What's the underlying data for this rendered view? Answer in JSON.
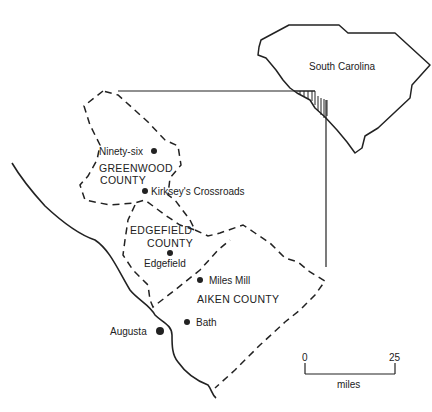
{
  "inset": {
    "state_label": "South Carolina"
  },
  "counties": [
    {
      "line1": "GREENWOOD",
      "line2": "COUNTY"
    },
    {
      "line1": "EDGEFIELD",
      "line2": "COUNTY"
    },
    {
      "line1": "AIKEN COUNTY"
    }
  ],
  "places": [
    {
      "name": "Ninety-six"
    },
    {
      "name": "Kirksey's Crossroads"
    },
    {
      "name": "Edgefield"
    },
    {
      "name": "Miles  Mill"
    },
    {
      "name": "Bath"
    },
    {
      "name": "Augusta"
    }
  ],
  "scale_bar": {
    "min": "0",
    "max": "25",
    "unit": "miles"
  },
  "colors": {
    "ink": "#222222",
    "background": "#ffffff"
  }
}
